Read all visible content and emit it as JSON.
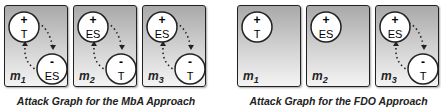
{
  "diagrams": [
    {
      "caption": "Attack Graph for the MbA Approach",
      "panels": [
        {
          "label": "m",
          "index": "1",
          "top_node": {
            "sign": "+",
            "name": "T"
          },
          "bottom_node": {
            "sign": "-",
            "name": "ES"
          },
          "has_edges": true
        },
        {
          "label": "m",
          "index": "2",
          "top_node": {
            "sign": "+",
            "name": "ES"
          },
          "bottom_node": {
            "sign": "-",
            "name": "T"
          },
          "has_edges": true
        },
        {
          "label": "m",
          "index": "3",
          "top_node": {
            "sign": "+",
            "name": "ES"
          },
          "bottom_node": {
            "sign": "-",
            "name": "T"
          },
          "has_edges": true
        }
      ]
    },
    {
      "caption": "Attack Graph for the FDO Approach",
      "panels": [
        {
          "label": "m",
          "index": "1",
          "top_node": {
            "sign": "+",
            "name": "T"
          },
          "bottom_node": null,
          "has_edges": false
        },
        {
          "label": "m",
          "index": "2",
          "top_node": {
            "sign": "+",
            "name": "ES"
          },
          "bottom_node": null,
          "has_edges": false
        },
        {
          "label": "m",
          "index": "3",
          "top_node": {
            "sign": "+",
            "name": "ES"
          },
          "bottom_node": {
            "sign": "-",
            "name": "T"
          },
          "has_edges": true
        }
      ]
    }
  ]
}
